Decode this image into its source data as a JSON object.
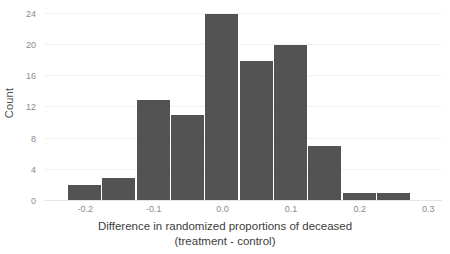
{
  "chart_data": {
    "type": "bar",
    "title": "",
    "subtitle": "",
    "xlabel_line1": "Difference in randomized proportions of deceased",
    "xlabel_line2": "(treatment - control)",
    "ylabel": "Count",
    "grid": true,
    "legend": "none",
    "bar_color": "#535353",
    "bin_width": 0.05,
    "xlim": [
      -0.26,
      0.32
    ],
    "ylim": [
      0,
      25
    ],
    "x_ticks": [
      {
        "value": -0.2,
        "label": "-0.2"
      },
      {
        "value": -0.1,
        "label": "-0.1"
      },
      {
        "value": 0.0,
        "label": "0.0"
      },
      {
        "value": 0.1,
        "label": "0.1"
      },
      {
        "value": 0.2,
        "label": "0.2"
      },
      {
        "value": 0.3,
        "label": "0.3"
      }
    ],
    "y_ticks": [
      {
        "value": 0,
        "label": "0"
      },
      {
        "value": 4,
        "label": "4"
      },
      {
        "value": 8,
        "label": "8"
      },
      {
        "value": 12,
        "label": "12"
      },
      {
        "value": 16,
        "label": "16"
      },
      {
        "value": 20,
        "label": "20"
      },
      {
        "value": 24,
        "label": "24"
      }
    ],
    "bins": [
      {
        "x0": -0.225,
        "x1": -0.175,
        "center": -0.2,
        "count": 2
      },
      {
        "x0": -0.175,
        "x1": -0.125,
        "center": -0.15,
        "count": 3
      },
      {
        "x0": -0.125,
        "x1": -0.075,
        "center": -0.1,
        "count": 13
      },
      {
        "x0": -0.075,
        "x1": -0.025,
        "center": -0.05,
        "count": 11
      },
      {
        "x0": -0.025,
        "x1": 0.025,
        "center": 0.0,
        "count": 24
      },
      {
        "x0": 0.025,
        "x1": 0.075,
        "center": 0.05,
        "count": 18
      },
      {
        "x0": 0.075,
        "x1": 0.125,
        "center": 0.1,
        "count": 20
      },
      {
        "x0": 0.125,
        "x1": 0.175,
        "center": 0.15,
        "count": 7
      },
      {
        "x0": 0.175,
        "x1": 0.225,
        "center": 0.2,
        "count": 1
      },
      {
        "x0": 0.225,
        "x1": 0.275,
        "center": 0.25,
        "count": 1
      }
    ],
    "categories": [
      "-0.2",
      "-0.15",
      "-0.1",
      "-0.05",
      "0.0",
      "0.05",
      "0.1",
      "0.15",
      "0.2",
      "0.25"
    ],
    "values": [
      2,
      3,
      13,
      11,
      24,
      18,
      20,
      7,
      1,
      1
    ]
  }
}
